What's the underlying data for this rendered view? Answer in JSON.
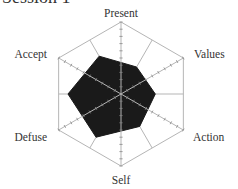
{
  "title": "Session 1",
  "chart_data": {
    "type": "radar",
    "title": "Session 1",
    "axes": [
      "Present",
      "Values",
      "Action",
      "Self",
      "Defuse",
      "Accept"
    ],
    "scale": [
      0,
      10
    ],
    "ticks_per_axis": 10,
    "data_spokes": [
      "Present-Values",
      "Values-Action",
      "Action-Self",
      "Self-Defuse",
      "Defuse-Accept",
      "Accept-Present"
    ],
    "series": [
      {
        "name": "Session 1",
        "values": [
          5,
          5.5,
          6,
          8,
          8.5,
          7
        ],
        "color": "#1a1a1a"
      }
    ],
    "grid": true,
    "legend": "none"
  },
  "labels": {
    "present": "Present",
    "values": "Values",
    "action": "Action",
    "self": "Self",
    "defuse": "Defuse",
    "accept": "Accept"
  }
}
